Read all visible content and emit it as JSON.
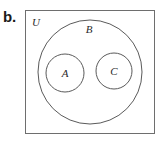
{
  "figure": {
    "part_label": "b.",
    "type": "venn-diagram",
    "width": 165,
    "height": 142,
    "background_color": "#ffffff",
    "stroke_color": "#5a5a5a",
    "rect_stroke_color": "#6e6e6e",
    "text_color": "#2a2a2a"
  },
  "universe": {
    "label": "U",
    "label_x": 36,
    "label_y": 26,
    "rect": {
      "x": 25,
      "y": 10,
      "width": 130,
      "height": 124
    }
  },
  "sets": [
    {
      "name": "set-b",
      "label": "B",
      "cx": 90,
      "cy": 72,
      "r": 52,
      "label_x": 89,
      "label_y": 33
    },
    {
      "name": "set-a",
      "label": "A",
      "cx": 65,
      "cy": 73,
      "r": 19,
      "label_x": 65,
      "label_y": 77
    },
    {
      "name": "set-c",
      "label": "C",
      "cx": 114,
      "cy": 71,
      "r": 18,
      "label_x": 114,
      "label_y": 75
    }
  ],
  "relations": {
    "description": "A and C are disjoint subsets of B; B is a subset of universe U"
  }
}
